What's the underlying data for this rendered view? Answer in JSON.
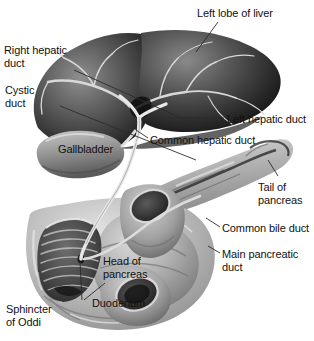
{
  "figure": {
    "background_color": "#ffffff",
    "label_color": "#111111",
    "leader_line_color": "#2b2b2b",
    "width": 314,
    "height": 341
  },
  "labels": [
    {
      "id": "left-lobe-of-liver",
      "name": "label-left-lobe-of-liver",
      "lines": [
        "Left lobe of liver"
      ],
      "x": 197,
      "y": 7,
      "align": "left",
      "on_organ": false
    },
    {
      "id": "right-hepatic-duct",
      "name": "label-right-hepatic-duct",
      "lines": [
        "Right hepatic",
        "duct"
      ],
      "x": 4,
      "y": 44,
      "align": "left",
      "on_organ": false
    },
    {
      "id": "cystic-duct",
      "name": "label-cystic-duct",
      "lines": [
        "Cystic",
        "duct"
      ],
      "x": 5,
      "y": 84,
      "align": "left",
      "on_organ": false
    },
    {
      "id": "left-hepatic-duct",
      "name": "label-left-hepatic-duct",
      "lines": [
        "Left hepatic duct"
      ],
      "x": 227,
      "y": 113,
      "align": "left",
      "on_organ": false
    },
    {
      "id": "common-hepatic-duct",
      "name": "label-common-hepatic-duct",
      "lines": [
        "Common hepatic duct"
      ],
      "x": 150,
      "y": 134,
      "align": "left",
      "on_organ": false
    },
    {
      "id": "gallbladder",
      "name": "label-gallbladder",
      "lines": [
        "Gallbladder"
      ],
      "x": 58,
      "y": 143,
      "align": "left",
      "on_organ": true
    },
    {
      "id": "tail-of-pancreas",
      "name": "label-tail-of-pancreas",
      "lines": [
        "Tail of",
        "pancreas"
      ],
      "x": 258,
      "y": 181,
      "align": "left",
      "on_organ": false
    },
    {
      "id": "common-bile-duct",
      "name": "label-common-bile-duct",
      "lines": [
        "Common bile duct"
      ],
      "x": 222,
      "y": 222,
      "align": "left",
      "on_organ": false
    },
    {
      "id": "main-pancreatic-duct",
      "name": "label-main-pancreatic-duct",
      "lines": [
        "Main pancreatic",
        "duct"
      ],
      "x": 222,
      "y": 248,
      "align": "left",
      "on_organ": false
    },
    {
      "id": "head-of-pancreas",
      "name": "label-head-of-pancreas",
      "lines": [
        "Head of",
        "pancreas"
      ],
      "x": 103,
      "y": 255,
      "align": "left",
      "on_organ": true
    },
    {
      "id": "duodenum",
      "name": "label-duodenum",
      "lines": [
        "Duodenum"
      ],
      "x": 92,
      "y": 297,
      "align": "left",
      "on_organ": true
    },
    {
      "id": "sphincter-of-oddi",
      "name": "label-sphincter-of-oddi",
      "lines": [
        "Sphincter",
        "of Oddi"
      ],
      "x": 6,
      "y": 303,
      "align": "left",
      "on_organ": false
    }
  ],
  "structures": [
    {
      "id": "liver",
      "name": "liver-right-and-left-lobes"
    },
    {
      "id": "gallbladder",
      "name": "gallbladder-body"
    },
    {
      "id": "cystic-duct",
      "name": "cystic-duct-structure"
    },
    {
      "id": "hepatic-ducts",
      "name": "hepatic-duct-confluence"
    },
    {
      "id": "common-bile-duct",
      "name": "common-bile-duct-structure"
    },
    {
      "id": "pancreas-body",
      "name": "pancreas-body-and-tail"
    },
    {
      "id": "pancreas-head",
      "name": "pancreas-head"
    },
    {
      "id": "duodenum",
      "name": "duodenum-loop"
    },
    {
      "id": "duodenum-lumen",
      "name": "duodenum-opened-lumen"
    },
    {
      "id": "sphincter",
      "name": "sphincter-of-oddi-papilla"
    }
  ]
}
